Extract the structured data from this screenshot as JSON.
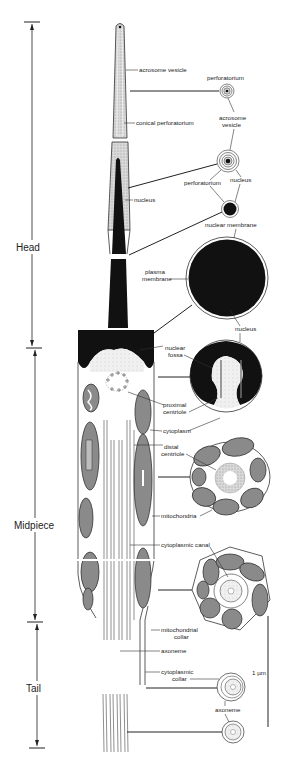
{
  "regions": [
    {
      "label": "Head",
      "top": 22,
      "bottom": 348
    },
    {
      "label": "Midpiece",
      "top": 348,
      "bottom": 622
    },
    {
      "label": "Tail",
      "top": 622,
      "bottom": 748
    }
  ],
  "scale_bar": {
    "label": "1 µm"
  },
  "longitudinal_labels": {
    "acrosome_vesicle": "acrosome vesicle",
    "conical_perforatorium": "conical perforatorium",
    "nucleus_head": "nucleus",
    "plasma_membrane": "plasma membrane",
    "nuclear_fossa": "nuclear fossa",
    "proximal_centriole": "proximal centriole",
    "cytoplasm": "cytoplasm",
    "distal_centriole": "distal centriole",
    "mitochondria": "mitochondria",
    "cytoplasmic_canal": "cytoplasmic canal",
    "mitochondrial_collar": "mitochondrial collar",
    "axoneme": "axoneme",
    "cytoplasmic_collar": "cytoplasmic collar"
  },
  "cross_section_labels": {
    "perforatorium_1": "perforatorium",
    "acrosome_vesicle_xs": "acrosome vesicle",
    "perforatorium_2": "perforatorium",
    "nucleus_xs": "nucleus",
    "nuclear_membrane": "nuclear membrane",
    "nucleus_large": "nucleus",
    "axoneme_xs": "axoneme"
  },
  "split_labels": {
    "acrosome_1": "acrosome",
    "acrosome_2": "vesicle",
    "plasma_1": "plasma",
    "plasma_2": "membrane",
    "fossa_1": "nuclear",
    "fossa_2": "fossa",
    "prox_1": "proximal",
    "prox_2": "centriole",
    "distal_1": "distal",
    "distal_2": "centriole",
    "mcollar_1": "mitochondrial",
    "mcollar_2": "collar",
    "ccollar_1": "cytoplasmic",
    "ccollar_2": "collar"
  }
}
